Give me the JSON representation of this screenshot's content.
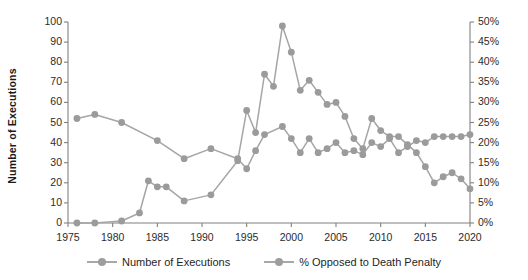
{
  "chart_data": {
    "type": "line",
    "title": "",
    "xlabel": "",
    "ylabel": "Number of Executions",
    "y2label": "Percent Opposed to the Death Penalty",
    "xlim": [
      1975,
      2020
    ],
    "ylim": [
      0,
      100
    ],
    "y2lim": [
      0,
      50
    ],
    "grid": false,
    "legend_position": "bottom",
    "x_ticks": [
      "1975",
      "1980",
      "1985",
      "1990",
      "1995",
      "2000",
      "2005",
      "2010",
      "2015",
      "2020"
    ],
    "y_ticks": [
      "0",
      "10",
      "20",
      "30",
      "40",
      "50",
      "60",
      "70",
      "80",
      "90",
      "100"
    ],
    "y2_ticks": [
      "0%",
      "5%",
      "10%",
      "15%",
      "20%",
      "25%",
      "30%",
      "35%",
      "40%",
      "45%",
      "50%"
    ],
    "series": [
      {
        "name": "Number of Executions",
        "axis": "left",
        "color": "#a5a5a5",
        "marker_color": "#9b9b9b",
        "x": [
          1976,
          1978,
          1981,
          1983,
          1984,
          1985,
          1986,
          1988,
          1991,
          1994,
          1995,
          1996,
          1997,
          1998,
          1999,
          2000,
          2001,
          2002,
          2003,
          2004,
          2005,
          2006,
          2007,
          2008,
          2009,
          2010,
          2011,
          2012,
          2013,
          2014,
          2015,
          2016,
          2017,
          2018,
          2019,
          2020
        ],
        "values": [
          0,
          0,
          1,
          5,
          21,
          18,
          18,
          11,
          14,
          31,
          56,
          45,
          74,
          68,
          98,
          85,
          66,
          71,
          65,
          59,
          60,
          53,
          42,
          37,
          52,
          46,
          43,
          43,
          39,
          35,
          28,
          20,
          23,
          25,
          22,
          17
        ]
      },
      {
        "name": "% Opposed to Death Penalty",
        "axis": "right",
        "color": "#a5a5a5",
        "marker_color": "#9b9b9b",
        "x": [
          1976,
          1978,
          1981,
          1985,
          1988,
          1991,
          1994,
          1995,
          1996,
          1997,
          1999,
          2000,
          2001,
          2002,
          2003,
          2004,
          2005,
          2006,
          2007,
          2008,
          2009,
          2010,
          2011,
          2012,
          2013,
          2014,
          2015,
          2016,
          2017,
          2018,
          2019,
          2020
        ],
        "values": [
          26,
          27,
          25,
          20.5,
          16,
          18.5,
          16,
          13.5,
          18,
          22,
          24,
          21,
          17.5,
          21,
          17.5,
          18.5,
          20,
          17.5,
          18,
          17,
          20,
          19,
          21,
          17.5,
          19,
          20.5,
          20,
          21.5,
          21.5,
          21.5,
          21.5,
          22
        ]
      }
    ]
  },
  "axes": {
    "left_title": "Number of Executions",
    "right_title": "Percent Opposed to the Death Penalty"
  },
  "legend": {
    "items": [
      {
        "label": "Number of Executions"
      },
      {
        "label": "% Opposed to Death Penalty"
      }
    ]
  }
}
